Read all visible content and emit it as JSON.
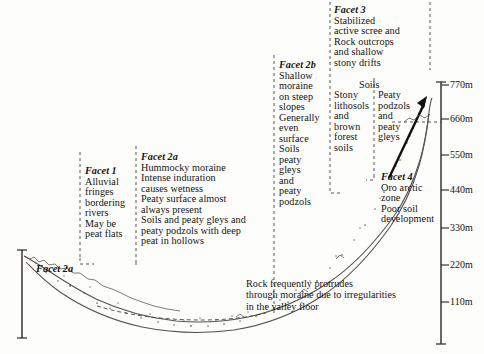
{
  "figure": {
    "type": "landform-facet-cross-section",
    "caption_note": "Rock frequently protrudes through moraine due to irregularities in the valley floor"
  },
  "facets": {
    "facet1": {
      "title": "Facet 1",
      "lines": [
        "Alluvial",
        "fringes",
        "bordering",
        "rivers",
        "May be",
        "peat flats"
      ]
    },
    "facet2a": {
      "title": "Facet 2a",
      "lines": [
        "Hummocky moraine",
        "Intense induration",
        "causes wetness",
        "Peaty surface almost",
        "always present",
        "Soils and peaty gleys and",
        "peaty podzols with deep",
        "peat in hollows"
      ],
      "inline_label": "Facet 2a"
    },
    "facet2b": {
      "title": "Facet 2b",
      "lines": [
        "Shallow",
        "moraine",
        "on steep",
        "slopes",
        "Generally",
        "even",
        "surface",
        "Soils",
        "peaty",
        "gleys",
        "and",
        "peaty",
        "podzols"
      ]
    },
    "facet3": {
      "title": "Facet 3",
      "lines": [
        "Stabilized",
        "active scree and",
        "Rock outcrops",
        "and shallow",
        "stony drifts"
      ],
      "soils_header": "Soils",
      "soils_left": [
        "Stony",
        "lithosols",
        "and",
        "brown",
        "forest",
        "soils"
      ],
      "soils_right": [
        "Peaty",
        "podzols",
        "and",
        "peaty",
        "gleys"
      ]
    },
    "facet4": {
      "title": "Facet 4",
      "lines": [
        "Oro  arctic",
        "zone",
        "Poor soil",
        "development"
      ]
    }
  },
  "caption": {
    "lines": [
      "Rock frequently protrudes",
      "through moraine due to irregularities",
      "in the valley floor"
    ]
  },
  "axis": {
    "name": "elevation-axis",
    "unit": "m",
    "ticks": [
      {
        "label": "770m",
        "value": 770,
        "y": 85
      },
      {
        "label": "660m",
        "value": 660,
        "y": 119
      },
      {
        "label": "550m",
        "value": 550,
        "y": 155
      },
      {
        "label": "440m",
        "value": 440,
        "y": 190
      },
      {
        "label": "330m",
        "value": 330,
        "y": 228
      },
      {
        "label": "220m",
        "value": 220,
        "y": 265
      },
      {
        "label": "110m",
        "value": 110,
        "y": 302
      }
    ]
  },
  "colors": {
    "ink": "#17130f",
    "line": "#3b352f",
    "dash": "#4a443d",
    "background": "#fdfdfc"
  }
}
